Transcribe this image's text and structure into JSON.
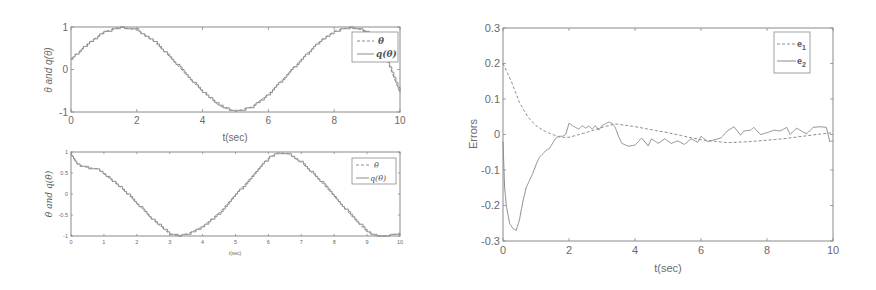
{
  "chart_data": [
    {
      "id": "theta",
      "type": "line",
      "title": "",
      "xlabel": "t(sec)",
      "ylabel": "θ and q(θ)",
      "xlim": [
        0,
        10
      ],
      "ylim": [
        -1,
        1
      ],
      "xticks": [
        0,
        2,
        4,
        6,
        8,
        10
      ],
      "yticks": [
        -1,
        0,
        1
      ],
      "grid": false,
      "legend_position": "upper right",
      "x": [
        0,
        0.5,
        1.0,
        1.5,
        2.0,
        2.5,
        3.0,
        3.5,
        4.0,
        4.5,
        5.0,
        5.5,
        6.0,
        6.5,
        7.0,
        7.5,
        8.0,
        8.5,
        9.0,
        9.5,
        10.0
      ],
      "series": [
        {
          "name": "θ",
          "style": "dashed",
          "values": [
            0.25,
            0.6,
            0.88,
            1.0,
            0.93,
            0.68,
            0.3,
            -0.12,
            -0.52,
            -0.85,
            -0.99,
            -0.88,
            -0.58,
            -0.18,
            0.24,
            0.62,
            0.9,
            1.0,
            0.9,
            0.44,
            -0.55
          ]
        },
        {
          "name": "q(θ)",
          "style": "solid",
          "values": [
            0.25,
            0.6,
            0.88,
            1.0,
            0.93,
            0.68,
            0.3,
            -0.12,
            -0.52,
            -0.85,
            -0.99,
            -0.88,
            -0.58,
            -0.18,
            0.24,
            0.62,
            0.9,
            1.0,
            0.9,
            0.44,
            -0.55
          ]
        }
      ]
    },
    {
      "id": "theta_dot",
      "type": "line",
      "title": "",
      "xlabel": "t(sec)",
      "ylabel": "θ̇ and q(θ̇)",
      "xlim": [
        0,
        10
      ],
      "ylim": [
        -1,
        1
      ],
      "xticks": [
        0,
        1,
        2,
        3,
        4,
        5,
        6,
        7,
        8,
        9,
        10
      ],
      "yticks": [
        -1,
        -0.5,
        0,
        0.5,
        1
      ],
      "grid": false,
      "legend_position": "upper right",
      "x": [
        0,
        0.2,
        0.5,
        0.8,
        1.0,
        1.5,
        2.0,
        2.5,
        3.0,
        3.3,
        3.6,
        4.0,
        4.5,
        5.0,
        5.5,
        6.0,
        6.3,
        6.6,
        7.0,
        7.5,
        8.0,
        8.5,
        9.0,
        9.3,
        9.6,
        10.0
      ],
      "series": [
        {
          "name": "θ̇",
          "style": "dashed",
          "values": [
            0.95,
            0.7,
            0.63,
            0.6,
            0.48,
            0.17,
            -0.22,
            -0.62,
            -0.95,
            -1.0,
            -0.93,
            -0.78,
            -0.45,
            -0.02,
            0.42,
            0.86,
            0.98,
            0.96,
            0.75,
            0.38,
            -0.05,
            -0.5,
            -0.9,
            -1.0,
            -1.0,
            -0.93
          ]
        },
        {
          "name": "q(θ̇)",
          "style": "solid",
          "values": [
            0.95,
            0.7,
            0.63,
            0.6,
            0.48,
            0.17,
            -0.22,
            -0.62,
            -0.95,
            -1.0,
            -0.93,
            -0.78,
            -0.45,
            -0.02,
            0.42,
            0.86,
            0.98,
            0.96,
            0.75,
            0.38,
            -0.05,
            -0.5,
            -0.9,
            -1.0,
            -1.0,
            -0.93
          ]
        }
      ]
    },
    {
      "id": "errors",
      "type": "line",
      "title": "",
      "xlabel": "t(sec)",
      "ylabel": "Errors",
      "xlim": [
        0,
        10
      ],
      "ylim": [
        -0.3,
        0.3
      ],
      "xticks": [
        0,
        2,
        4,
        6,
        8,
        10
      ],
      "yticks": [
        -0.3,
        -0.2,
        -0.1,
        0,
        0.1,
        0.2,
        0.3
      ],
      "grid": false,
      "legend_position": "upper right",
      "series": [
        {
          "name": "e1",
          "style": "dashed",
          "x": [
            0,
            0.25,
            0.5,
            0.75,
            1.0,
            1.25,
            1.5,
            1.75,
            2.0,
            2.5,
            3.0,
            3.4,
            4.0,
            5.0,
            6.0,
            6.8,
            7.5,
            8.5,
            9.5,
            10.0
          ],
          "values": [
            0.2,
            0.15,
            0.09,
            0.05,
            0.025,
            0.01,
            0.0,
            -0.008,
            -0.008,
            0.005,
            0.02,
            0.03,
            0.022,
            0.005,
            -0.015,
            -0.023,
            -0.02,
            -0.012,
            0.0,
            0.005
          ]
        },
        {
          "name": "e2",
          "style": "solid",
          "x": [
            0,
            0.05,
            0.1,
            0.2,
            0.3,
            0.4,
            0.5,
            0.6,
            0.7,
            0.8,
            0.9,
            1.0,
            1.1,
            1.2,
            1.3,
            1.4,
            1.5,
            1.6,
            1.7,
            1.8,
            1.9,
            2.0,
            2.1,
            2.2,
            2.3,
            2.4,
            2.5,
            2.6,
            2.7,
            2.8,
            2.9,
            3.0,
            3.1,
            3.2,
            3.3,
            3.4,
            3.5,
            3.6,
            3.8,
            4.0,
            4.2,
            4.4,
            4.5,
            4.7,
            4.9,
            5.1,
            5.3,
            5.5,
            5.7,
            5.9,
            6.0,
            6.2,
            6.4,
            6.6,
            6.8,
            7.0,
            7.2,
            7.3,
            7.5,
            7.6,
            7.8,
            8.0,
            8.2,
            8.4,
            8.6,
            8.7,
            8.9,
            9.0,
            9.2,
            9.4,
            9.6,
            9.8,
            9.9,
            10.0
          ],
          "values": [
            -0.02,
            -0.15,
            -0.2,
            -0.25,
            -0.265,
            -0.27,
            -0.24,
            -0.19,
            -0.15,
            -0.13,
            -0.11,
            -0.085,
            -0.065,
            -0.055,
            -0.045,
            -0.04,
            -0.025,
            -0.01,
            -0.005,
            -0.005,
            0.0,
            0.032,
            0.025,
            0.02,
            0.015,
            0.025,
            0.018,
            0.024,
            0.015,
            0.025,
            0.012,
            0.025,
            0.03,
            0.035,
            0.032,
            0.02,
            -0.005,
            -0.025,
            -0.033,
            -0.03,
            -0.01,
            -0.032,
            -0.012,
            -0.025,
            -0.012,
            -0.025,
            -0.018,
            -0.028,
            -0.012,
            -0.022,
            -0.005,
            -0.02,
            -0.015,
            -0.01,
            0.01,
            0.022,
            -0.002,
            0.01,
            0.012,
            0.02,
            0.0,
            0.005,
            0.012,
            0.01,
            0.02,
            0.0,
            0.018,
            0.012,
            0.002,
            0.02,
            0.022,
            0.02,
            -0.02,
            -0.018
          ]
        }
      ]
    }
  ],
  "legends": {
    "theta": [
      {
        "label": "θ",
        "style": "dashed"
      },
      {
        "label": "q(θ)",
        "style": "solid"
      }
    ],
    "theta_dot": [
      {
        "label": "θ̇",
        "style": "dashed"
      },
      {
        "label": "q(θ̇)",
        "style": "solid"
      }
    ],
    "errors": [
      {
        "label": "e",
        "sub": "1",
        "style": "dashed"
      },
      {
        "label": "e",
        "sub": "2",
        "style": "solid"
      }
    ]
  },
  "colors": {
    "line": "#8c8c8c",
    "axis": "#8a8a8a",
    "text": "#6a6a6a"
  }
}
